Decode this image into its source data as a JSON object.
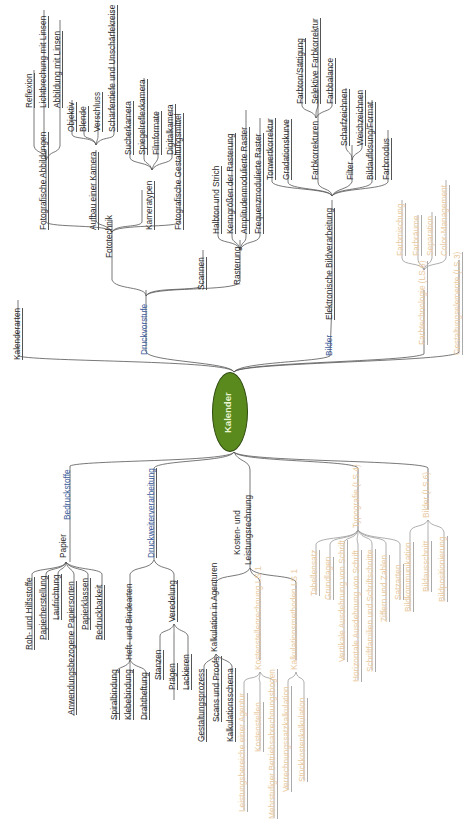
{
  "diagram": {
    "type": "mindmap",
    "orientation": "rotated-90-ccw",
    "colors": {
      "center_fill": "#5a8a1e",
      "main_branch": "#3a5a9a",
      "sub_text": "#2a2a2a",
      "pending_text": "#e9c9a0",
      "line": "#555555"
    },
    "center": {
      "label": "Kalender"
    },
    "top_branches": {
      "kalenderarten": "Kalenderarten",
      "druckvorstufe": {
        "label": "Druckvorstufe",
        "fototechnik": {
          "label": "Fototechnik",
          "fotografische_abbildungen": {
            "label": "Fotografische Abbildungen",
            "children": [
              "Reflexion",
              "Lichtbrechung mit Linsen",
              "Abbildung mit Linsen"
            ]
          },
          "aufbau_kamera": {
            "label": "Aufbau einer Kamera",
            "children": [
              "Objektiv",
              "Blende",
              "Verschluss",
              "Schärfentiefe und Unschärfekreise"
            ]
          },
          "kameratypen": {
            "label": "Kameratypen",
            "children": [
              "Sucherkamera",
              "Spiegelreflexkamera",
              "Filmformate",
              "Digitalkamera"
            ]
          },
          "gestaltungsmittel": "Fotografische Gestaltungsmittel"
        },
        "scannen": "Scannen",
        "rasterung": {
          "label": "Rasterung",
          "children": [
            "Halbton und Strich",
            "Kenngrößen der Rasterung",
            "Amplitudenmodulierte Raster",
            "Frequenzmodulierte Raster"
          ]
        }
      },
      "bilder": {
        "label": "Bilder",
        "elektronische": {
          "label": "Elektronische Bildverarbeitung",
          "tonwert": "Tonwertkorrektur",
          "gradation": "Gradationskurve",
          "farbkorrekturen": {
            "label": "Farbkorrekturen",
            "children": [
              "Farbton/Sättigung",
              "Selektive Farbkorrektur",
              "Farbbalance"
            ]
          },
          "filter": {
            "label": "Filter",
            "children": [
              "Scharfzeichnen",
              "Weichzeichnen"
            ]
          },
          "aufloesung": "Bildauflösung/Format",
          "farbmodus": "Farbmodus"
        }
      },
      "farbtechnologie": {
        "label": "Farbtechnologie (LS 6)",
        "children": [
          "Farbmischung",
          "Farbräume",
          "Separation",
          "Color-Management"
        ]
      },
      "gestaltungselemente": "Gestaltungselemente (LS 3)"
    },
    "bottom_branches": {
      "bedruckstoffe": {
        "label": "Bedruckstoffe",
        "papier": {
          "label": "Papier",
          "children": [
            "Roh- und Hilfsstoffe",
            "Papierherstellung",
            "Laufrichtung",
            "Anwendungsbezogene Papiersorten",
            "Papierklassen",
            "Bedruckbarkeit"
          ]
        }
      },
      "druckweiterverarbeitung": {
        "label": "Druckweiterverarbeitung",
        "heft": {
          "label": "Heft- und Bindearten",
          "children": [
            "Spiralbindung",
            "Klebebindung",
            "Drahtheftung"
          ]
        },
        "veredelung": {
          "label": "Veredelung",
          "children": [
            "Stanzen",
            "Prägen",
            "Lackieren"
          ]
        }
      },
      "kosten": {
        "label_line1": "Kosten- und",
        "label_line2": "Leistungsrechnung",
        "agenturen": {
          "label": "Kalkulation in Agenturen",
          "children": [
            "Gestaltungsprozess",
            "Scans und Proofs",
            "Kalkulationsschema"
          ]
        },
        "kostenstellen": {
          "label": "Kostenstellenrechnung LS 1",
          "children": [
            "Leistungsbereiche einer Agentur",
            "Kostenstellen",
            "Mehrstufiger Betriebsabrechnungsbogen"
          ]
        },
        "kalkulationsmethoden": {
          "label": "Kalkulationsmethoden LS 1",
          "children": [
            "Verrechnungssatzkalkulation",
            "Stückkostenkalkulation"
          ]
        }
      },
      "typografie": {
        "label": "Typografie (LS 4)",
        "children": [
          "Tabellensatz",
          "Grundlagen",
          "Vertikale Ausdehnung von Schrift",
          "Horizontale Ausdehnung von Schrift",
          "Schriftfamilien und Schriftschnitte",
          "Ziffern und Zahlen",
          "Satzarten"
        ]
      },
      "bilder_ls6": {
        "label": "Bilder (LS 6)",
        "children": [
          "Bildkommunikation",
          "Bildausschnitt",
          "Bildpositionierung"
        ]
      }
    }
  }
}
